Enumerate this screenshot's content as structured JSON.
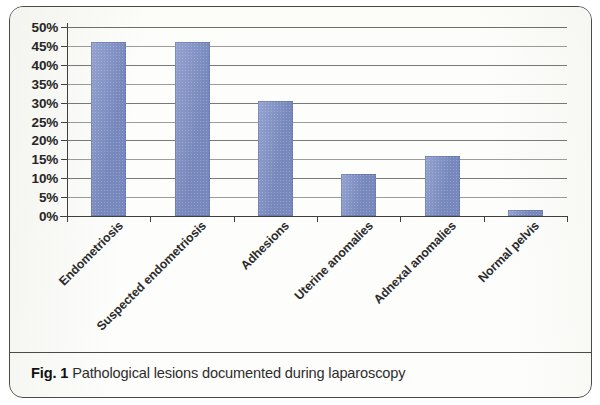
{
  "figure": {
    "caption_label": "Fig. 1",
    "caption_text": "Pathological lesions documented during laparoscopy"
  },
  "chart_data": {
    "type": "bar",
    "title": "",
    "subtitle": "",
    "xlabel": "",
    "ylabel": "",
    "categories": [
      "Endometriosis",
      "Suspected endometriosis",
      "Adhesions",
      "Uterine anomalies",
      "Adnexal anomalies",
      "Normal pelvis"
    ],
    "values": [
      46,
      46,
      30.5,
      11,
      16,
      1.5
    ],
    "value_unit": "%",
    "ylim": [
      0,
      50
    ],
    "ytick_values": [
      0,
      5,
      10,
      15,
      20,
      25,
      30,
      35,
      40,
      45,
      50
    ],
    "ytick_labels": [
      "0%",
      "5%",
      "10%",
      "15%",
      "20%",
      "25%",
      "30%",
      "35%",
      "40%",
      "45%",
      "50%"
    ],
    "grid": true,
    "grid_axis": "y",
    "legend": false,
    "legend_position": "none",
    "bar_color": "#7d8fc6",
    "axis_color": "#3f3f3f",
    "gridline_color": "#5c5c5c",
    "xtick_rotation": -45
  }
}
